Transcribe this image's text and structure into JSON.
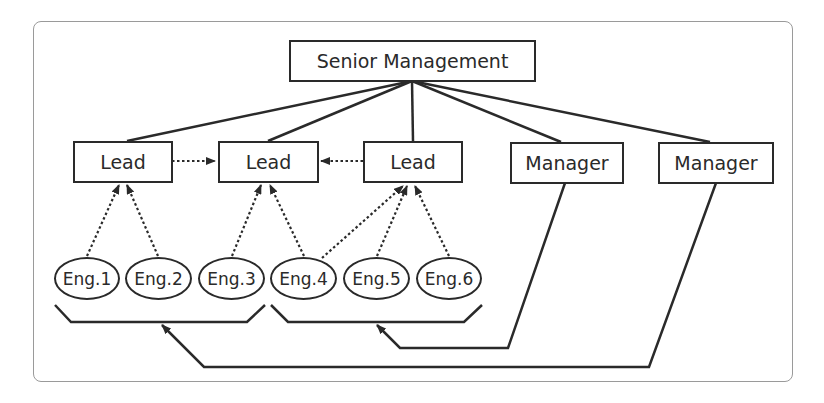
{
  "diagram": {
    "type": "org-chart",
    "top": {
      "label": "Senior Management"
    },
    "leads": [
      {
        "label": "Lead"
      },
      {
        "label": "Lead"
      },
      {
        "label": "Lead"
      }
    ],
    "managers": [
      {
        "label": "Manager"
      },
      {
        "label": "Manager"
      }
    ],
    "engineers": [
      {
        "label": "Eng.1"
      },
      {
        "label": "Eng.2"
      },
      {
        "label": "Eng.3"
      },
      {
        "label": "Eng.4"
      },
      {
        "label": "Eng.5"
      },
      {
        "label": "Eng.6"
      }
    ],
    "edges": {
      "solid_reporting": [
        [
          "Senior Management",
          "Lead 1"
        ],
        [
          "Senior Management",
          "Lead 2"
        ],
        [
          "Senior Management",
          "Lead 3"
        ],
        [
          "Senior Management",
          "Manager 1"
        ],
        [
          "Senior Management",
          "Manager 2"
        ]
      ],
      "dotted_reporting": [
        [
          "Eng.1",
          "Lead 1"
        ],
        [
          "Eng.2",
          "Lead 1"
        ],
        [
          "Eng.3",
          "Lead 2"
        ],
        [
          "Eng.4",
          "Lead 2"
        ],
        [
          "Eng.4",
          "Lead 3"
        ],
        [
          "Eng.5",
          "Lead 3"
        ],
        [
          "Eng.6",
          "Lead 3"
        ],
        [
          "Lead 1",
          "Lead 2"
        ],
        [
          "Lead 3",
          "Lead 2"
        ]
      ],
      "manager_groups": [
        {
          "manager": "Manager 1",
          "group": [
            "Eng.4",
            "Eng.5",
            "Eng.6"
          ]
        },
        {
          "manager": "Manager 2",
          "group": [
            "Eng.1",
            "Eng.2",
            "Eng.3"
          ]
        }
      ]
    },
    "colors": {
      "line": "#2a2a2a",
      "frame": "#9a9a9a",
      "background": "#ffffff"
    }
  }
}
